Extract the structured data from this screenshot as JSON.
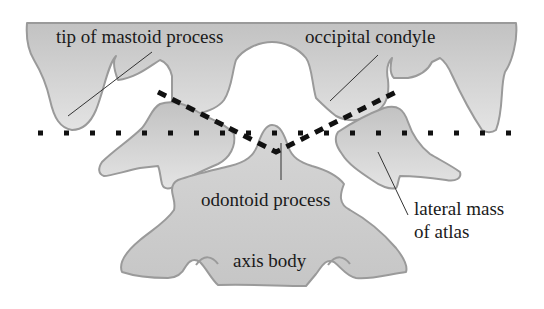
{
  "labels": {
    "mastoid": "tip of mastoid process",
    "condyle": "occipital condyle",
    "odontoid": "odontoid process",
    "lateral_mass_line1": "lateral mass",
    "lateral_mass_line2": "of atlas",
    "axis_body": "axis body"
  },
  "colors": {
    "bone_fill_top": "#c4c4c4",
    "bone_fill_bottom": "#e2e2e2",
    "bone_outline": "#9a9a9a",
    "line_color": "#111111",
    "text": "#1a1a1a"
  },
  "reference_lines": {
    "dotted": "horizontal bimastoid line",
    "dashed": "condylar / atlanto-occipital joint lines"
  }
}
